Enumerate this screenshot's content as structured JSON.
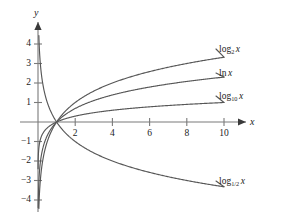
{
  "chart_data": {
    "type": "line",
    "title": "",
    "xlabel": "x",
    "ylabel": "y",
    "xlim": [
      -0.6,
      12.2
    ],
    "ylim": [
      -4.6,
      4.6
    ],
    "grid": false,
    "legend_position": "right-inline-labels",
    "x_ticks": [
      2,
      4,
      6,
      8,
      10
    ],
    "y_ticks": [
      4,
      3,
      2,
      1,
      -1,
      -2,
      -3,
      -4
    ],
    "x_tick_labels": [
      "2",
      "4",
      "6",
      "8",
      "10"
    ],
    "y_tick_labels": [
      "4",
      "3",
      "2",
      "1",
      "−1",
      "−2",
      "−3",
      "−4"
    ],
    "series": [
      {
        "name": "log_2 x",
        "label_html": "log<sub>2</sub> x",
        "base": 2,
        "color": "#575757",
        "x": [
          0.12,
          0.2,
          0.35,
          0.5,
          0.7,
          1.0,
          1.5,
          2.0,
          3.0,
          4.0,
          5.0,
          6.0,
          7.0,
          8.0,
          9.0,
          10.0
        ],
        "y": [
          -3.06,
          -2.32,
          -1.51,
          -1.0,
          -0.51,
          0.0,
          0.58,
          1.0,
          1.58,
          2.0,
          2.32,
          2.58,
          2.81,
          3.0,
          3.17,
          3.32
        ]
      },
      {
        "name": "ln x",
        "label_html": "ln x",
        "base": 2.718281828,
        "color": "#575757",
        "x": [
          0.12,
          0.2,
          0.35,
          0.5,
          0.7,
          1.0,
          1.5,
          2.0,
          3.0,
          4.0,
          5.0,
          6.0,
          7.0,
          8.0,
          9.0,
          10.0
        ],
        "y": [
          -2.12,
          -1.61,
          -1.05,
          -0.69,
          -0.36,
          0.0,
          0.41,
          0.69,
          1.1,
          1.39,
          1.61,
          1.79,
          1.95,
          2.08,
          2.2,
          2.3
        ]
      },
      {
        "name": "log_10 x",
        "label_html": "log<sub>10</sub> x",
        "base": 10,
        "color": "#575757",
        "x": [
          0.12,
          0.2,
          0.35,
          0.5,
          0.7,
          1.0,
          1.5,
          2.0,
          3.0,
          4.0,
          5.0,
          6.0,
          7.0,
          8.0,
          9.0,
          10.0
        ],
        "y": [
          -0.92,
          -0.7,
          -0.46,
          -0.3,
          -0.15,
          0.0,
          0.18,
          0.3,
          0.48,
          0.6,
          0.7,
          0.78,
          0.85,
          0.9,
          0.95,
          1.0
        ]
      },
      {
        "name": "log_1/2 x",
        "label_html": "log<sub>1/2</sub> x",
        "base": 0.5,
        "color": "#575757",
        "x": [
          0.12,
          0.2,
          0.35,
          0.5,
          0.7,
          1.0,
          1.5,
          2.0,
          3.0,
          4.0,
          5.0,
          6.0,
          7.0,
          8.0,
          9.0,
          10.0
        ],
        "y": [
          3.06,
          2.32,
          1.51,
          1.0,
          0.51,
          0.0,
          -0.58,
          -1.0,
          -1.58,
          -2.0,
          -2.32,
          -2.58,
          -2.81,
          -3.0,
          -3.17,
          -3.32
        ]
      }
    ]
  },
  "axes": {
    "x_label": "x",
    "y_label": "y"
  },
  "labels": {
    "log2": {
      "fn": "log",
      "sub": "2",
      "var": "x"
    },
    "ln": {
      "fn": "ln",
      "sub": "",
      "var": "x"
    },
    "log10": {
      "fn": "log",
      "sub": "10",
      "var": "x"
    },
    "loghalf": {
      "fn": "log",
      "sub": "1/2",
      "var": "x"
    }
  },
  "colors": {
    "curve": "#575757",
    "axis": "#7a7a7a",
    "text": "#1b1b1b",
    "background": "#ffffff"
  }
}
